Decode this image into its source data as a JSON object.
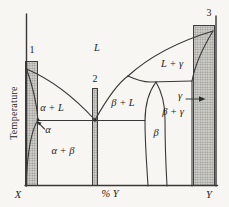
{
  "figure": {
    "type": "binary-phase-diagram",
    "axis": {
      "y_label": "Temperature",
      "x_left": "X",
      "x_center": "% Y",
      "x_right": "Y"
    },
    "composition_markers": [
      {
        "label": "1"
      },
      {
        "label": "2"
      },
      {
        "label": "3"
      }
    ],
    "regions": {
      "liquid": "L",
      "liquid_gamma": "L + γ",
      "alpha_liquid": "α + L",
      "beta_liquid": "β + L",
      "gamma": "γ",
      "beta_gamma": "β + γ",
      "beta": "β",
      "alpha": "α",
      "alpha_beta": "α + β"
    },
    "colors": {
      "background": "#f7f6f2",
      "line": "#383838",
      "bar_fill": "#cfcec9",
      "bar_dot": "#8d8d89",
      "text": "#1d1d1d"
    }
  }
}
